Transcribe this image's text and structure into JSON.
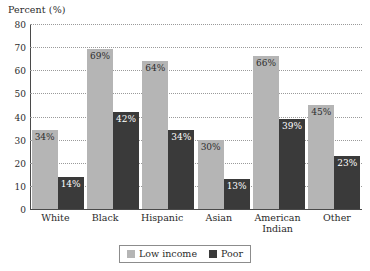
{
  "chart_data": {
    "type": "bar",
    "title": "",
    "xlabel": "",
    "ylabel": "Percent (%)",
    "ylim": [
      0,
      80
    ],
    "yticks": [
      0,
      10,
      20,
      30,
      40,
      50,
      60,
      70,
      80
    ],
    "ytick_labels": [
      "0",
      "10",
      "20",
      "30",
      "40",
      "50",
      "60",
      "70",
      "80"
    ],
    "grid": "horizontal-dotted",
    "legend_position": "bottom-center",
    "categories": [
      "White",
      "Black",
      "Hispanic",
      "Asian",
      "American Indian",
      "Other"
    ],
    "category_labels": [
      "White",
      "Black",
      "Hispanic",
      "Asian",
      "American\nIndian",
      "Other"
    ],
    "series": [
      {
        "name": "Low income",
        "color": "#b5b5b5",
        "values": [
          34,
          69,
          64,
          30,
          66,
          45
        ],
        "data_labels": [
          "34%",
          "69%",
          "64%",
          "30%",
          "66%",
          "45%"
        ]
      },
      {
        "name": "Poor",
        "color": "#3a3a3a",
        "values": [
          14,
          42,
          34,
          13,
          39,
          23
        ],
        "data_labels": [
          "14%",
          "42%",
          "34%",
          "13%",
          "39%",
          "23%"
        ]
      }
    ]
  },
  "axis": {
    "y_title": "Percent (%)"
  },
  "legend": {
    "items": [
      {
        "label": "Low income",
        "color": "#b5b5b5"
      },
      {
        "label": "Poor",
        "color": "#3a3a3a"
      }
    ]
  }
}
